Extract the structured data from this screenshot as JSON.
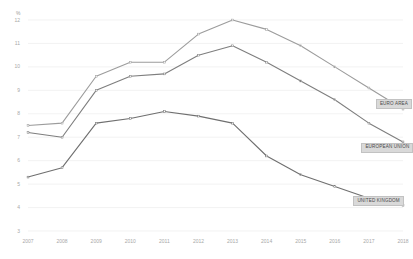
{
  "chart_data": {
    "type": "line",
    "title": "",
    "subtitle": "",
    "xlabel": "",
    "ylabel": "%",
    "unit_label": "%",
    "x": [
      "2007",
      "2008",
      "2009",
      "2010",
      "2011",
      "2012",
      "2013",
      "2014",
      "2015",
      "2016",
      "2017",
      "2018"
    ],
    "categories": [
      "2007",
      "2008",
      "2009",
      "2010",
      "2011",
      "2012",
      "2013",
      "2014",
      "2015",
      "2016",
      "2017",
      "2018"
    ],
    "xlim": [
      2007,
      2018
    ],
    "ylim": [
      3,
      12
    ],
    "yticks": [
      "12",
      "11",
      "10",
      "9",
      "8",
      "7",
      "6",
      "5",
      "4",
      "3"
    ],
    "ytick_values": [
      12,
      11,
      10,
      9,
      8,
      7,
      6,
      5,
      4,
      3
    ],
    "grid": true,
    "legend_position": "inline-right-end-labels",
    "series": [
      {
        "name": "EURO AREA",
        "color": "#9c9c9c",
        "values": [
          7.5,
          7.6,
          9.6,
          10.2,
          10.2,
          11.4,
          12.0,
          11.6,
          10.9,
          10.0,
          9.1,
          8.2
        ]
      },
      {
        "name": "EUROPEAN UNION",
        "color": "#7e7e7e",
        "values": [
          7.2,
          7.0,
          9.0,
          9.6,
          9.7,
          10.5,
          10.9,
          10.2,
          9.4,
          8.6,
          7.6,
          6.8
        ]
      },
      {
        "name": "UNITED KINGDOM",
        "color": "#6f6f6f",
        "values": [
          5.3,
          5.7,
          7.6,
          7.8,
          8.1,
          7.9,
          7.6,
          6.2,
          5.4,
          4.9,
          4.4,
          4.1
        ]
      }
    ],
    "colors": {
      "grid": "#ececec",
      "axis_text": "#a8a8a8",
      "legend_bg": "#d9d9d9",
      "legend_border": "#c2c2c2",
      "legend_text": "#4a4a4a",
      "background": "#ffffff"
    }
  }
}
